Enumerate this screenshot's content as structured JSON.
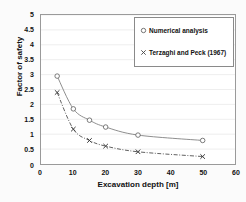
{
  "chart_data": {
    "type": "line",
    "title": "",
    "xlabel": "Excavation depth [m]",
    "ylabel": "Factor of safety",
    "xlim": [
      0,
      60
    ],
    "ylim": [
      0,
      5
    ],
    "xticks": [
      0,
      10,
      20,
      30,
      40,
      50,
      60
    ],
    "yticks": [
      0,
      0.5,
      1,
      1.5,
      2,
      2.5,
      3,
      3.5,
      4,
      4.5,
      5
    ],
    "xtick_labels": [
      "0",
      "10",
      "20",
      "30",
      "40",
      "50",
      "60"
    ],
    "ytick_labels": [
      "0",
      "0.5",
      "1",
      "1.5",
      "2",
      "2.5",
      "3",
      "3.5",
      "4",
      "4.5",
      "5"
    ],
    "grid": "horizontal",
    "legend_position": "upper-right",
    "series": [
      {
        "name": "Numerical analysis",
        "marker": "circle-open",
        "linestyle": "solid",
        "color": "#808080",
        "x": [
          5,
          10,
          15,
          20,
          30,
          50
        ],
        "values": [
          2.95,
          1.85,
          1.47,
          1.24,
          0.97,
          0.79
        ]
      },
      {
        "name": "Terzaghi and Peck (1967)",
        "marker": "x",
        "linestyle": "dash-dot",
        "color": "#4d4d4d",
        "x": [
          5,
          10,
          15,
          20,
          30,
          50
        ],
        "values": [
          2.4,
          1.17,
          0.79,
          0.6,
          0.41,
          0.25
        ]
      }
    ]
  },
  "legend": {
    "entries": [
      {
        "label": "Numerical analysis",
        "marker": "circle-open"
      },
      {
        "label": "Terzaghi and Peck (1967)",
        "marker": "x"
      }
    ]
  },
  "colors": {
    "plot_background": "#ffffff",
    "figure_background": "#fbfbfb",
    "axis": "#9a9a9a",
    "grid": "#e6e6e6",
    "series_1": "#808080",
    "series_2": "#4d4d4d",
    "text": "#111111"
  }
}
